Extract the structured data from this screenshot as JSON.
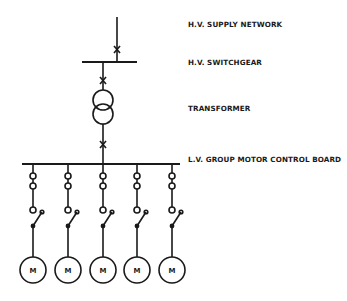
{
  "diagram": {
    "type": "single-line electrical distribution diagram",
    "labels": {
      "hv_supply": "H.V. SUPPLY NETWORK",
      "hv_switchgear": "H.V. SWITCHGEAR",
      "transformer": "TRANSFORMER",
      "lv_board": "L.V. GROUP MOTOR CONTROL BOARD"
    },
    "motor_symbol": "M",
    "motor_count": 5,
    "colors": {
      "line": "#1a1a1a",
      "background": "#ffffff"
    },
    "motors": [
      {
        "label": "M"
      },
      {
        "label": "M"
      },
      {
        "label": "M"
      },
      {
        "label": "M"
      },
      {
        "label": "M"
      }
    ]
  }
}
